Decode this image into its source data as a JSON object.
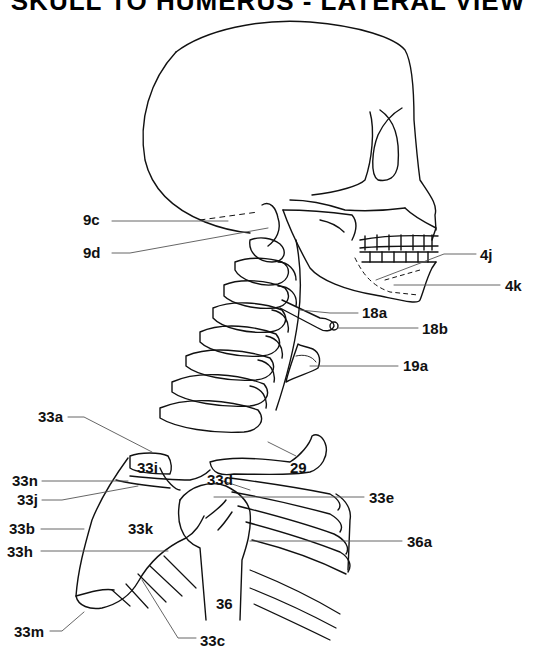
{
  "title": "SKULL TO HUMERUS - LATERAL VIEW",
  "colors": {
    "line": "#111111",
    "leader": "#555555",
    "background": "#ffffff"
  },
  "labels": [
    {
      "id": "9c",
      "text": "9c",
      "x": 83,
      "y": 212
    },
    {
      "id": "9d",
      "text": "9d",
      "x": 83,
      "y": 245
    },
    {
      "id": "4j",
      "text": "4j",
      "x": 480,
      "y": 251
    },
    {
      "id": "4k",
      "text": "4k",
      "x": 505,
      "y": 278
    },
    {
      "id": "18a",
      "text": "18a",
      "x": 362,
      "y": 305
    },
    {
      "id": "18b",
      "text": "18b",
      "x": 422,
      "y": 321
    },
    {
      "id": "19a",
      "text": "19a",
      "x": 403,
      "y": 358
    },
    {
      "id": "33a",
      "text": "33a",
      "x": 38,
      "y": 409
    },
    {
      "id": "33i",
      "text": "33i",
      "x": 137,
      "y": 460
    },
    {
      "id": "29",
      "text": "29",
      "x": 290,
      "y": 460
    },
    {
      "id": "33n",
      "text": "33n",
      "x": 12,
      "y": 473
    },
    {
      "id": "33d",
      "text": "33d",
      "x": 207,
      "y": 472
    },
    {
      "id": "33j",
      "text": "33j",
      "x": 17,
      "y": 492
    },
    {
      "id": "33e",
      "text": "33e",
      "x": 369,
      "y": 490
    },
    {
      "id": "33b",
      "text": "33b",
      "x": 9,
      "y": 521
    },
    {
      "id": "33k",
      "text": "33k",
      "x": 128,
      "y": 521
    },
    {
      "id": "36a",
      "text": "36a",
      "x": 407,
      "y": 534
    },
    {
      "id": "33h",
      "text": "33h",
      "x": 7,
      "y": 544
    },
    {
      "id": "36",
      "text": "36",
      "x": 216,
      "y": 596
    },
    {
      "id": "33m",
      "text": "33m",
      "x": 14,
      "y": 624
    },
    {
      "id": "33c",
      "text": "33c",
      "x": 200,
      "y": 633
    }
  ]
}
